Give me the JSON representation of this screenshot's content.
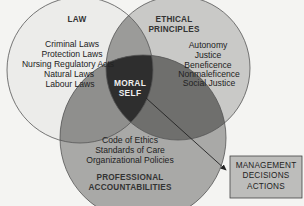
{
  "diagram": {
    "circles": {
      "law": {
        "title": "LAW",
        "items": [
          "Criminal Laws",
          "Protection Laws",
          "Nursing Regulatory Acts",
          "Natural Laws",
          "Labour Laws"
        ]
      },
      "ethical": {
        "title_lines": [
          "ETHICAL",
          "PRINCIPLES"
        ],
        "items": [
          "Autonomy",
          "Justice",
          "Beneficence",
          "Nonmaleficence",
          "Social Justice"
        ]
      },
      "professional": {
        "items": [
          "Code of Ethics",
          "Standards of Care",
          "Organizational Policies"
        ],
        "title_lines": [
          "PROFESSIONAL",
          "ACCOUNTABILITIES"
        ]
      }
    },
    "center": {
      "lines": [
        "MORAL",
        "SELF"
      ]
    },
    "outcome_box": {
      "lines": [
        "MANAGEMENT",
        "DECISIONS",
        "ACTIONS"
      ]
    },
    "colors": {
      "background": "#f4f4f2",
      "law_fill": "#ececea",
      "ethical_fill": "#c9c9c7",
      "professional_fill": "#a9a9a7",
      "law_ethical_overlap": "#9b9b99",
      "law_prof_overlap": "#8f8f8d",
      "ethical_prof_overlap": "#6f6f6d",
      "moral_self_fill": "#2e2e2e",
      "outline": "#555555",
      "box_fill": "#bdbdbb"
    }
  }
}
